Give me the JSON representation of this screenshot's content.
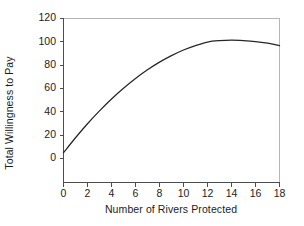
{
  "chart_data": {
    "type": "line",
    "title": "",
    "xlabel": "Number of Rivers Protected",
    "ylabel": "Total Willingness to Pay",
    "xlim": [
      0,
      18
    ],
    "ylim": [
      0,
      120
    ],
    "xticks": [
      0,
      2,
      4,
      6,
      8,
      10,
      12,
      14,
      16,
      18
    ],
    "yticks": [
      0,
      20,
      40,
      60,
      80,
      100,
      120
    ],
    "grid": false,
    "legend": null,
    "series": [
      {
        "name": "Total Willingness to Pay",
        "color": "#262626",
        "x": [
          0,
          1,
          2,
          3,
          4,
          5,
          6,
          7,
          8,
          9,
          10,
          11,
          12,
          13,
          14,
          15,
          16,
          17,
          18
        ],
        "values": [
          5,
          17.8,
          29.8,
          40.8,
          51.0,
          60.2,
          68.6,
          76.0,
          82.6,
          88.2,
          93.0,
          96.8,
          99.8,
          101.0,
          101.4,
          101.0,
          100.2,
          98.8,
          96.8
        ]
      }
    ]
  },
  "axes": {
    "ylabel_text": "Total Willingness to Pay",
    "xlabel_text": "Number of Rivers Protected",
    "ytick_labels": [
      "0",
      "20",
      "40",
      "60",
      "80",
      "100",
      "120"
    ],
    "xtick_labels": [
      "0",
      "2",
      "4",
      "6",
      "8",
      "10",
      "12",
      "14",
      "16",
      "18"
    ]
  },
  "style": {
    "line_color": "#262626",
    "axis_color": "#4d4d4d",
    "frame_color": "#b5b5b5",
    "text_color": "#1c1c1c",
    "background": "#ffffff"
  }
}
